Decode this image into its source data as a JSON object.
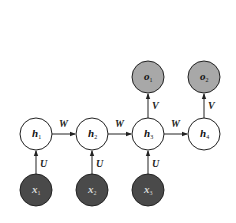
{
  "diagram": {
    "colors": {
      "hidden_fill": "#ffffff",
      "output_fill": "#a8a8a8",
      "input_fill": "#4a4a4a",
      "stroke": "#222222",
      "input_text": "#d8d8d8"
    },
    "hidden_nodes": [
      {
        "id": "h1",
        "base": "h",
        "sub": "1",
        "x": 36,
        "y": 134
      },
      {
        "id": "h2",
        "base": "h",
        "sub": "2",
        "x": 92,
        "y": 134
      },
      {
        "id": "h3",
        "base": "h",
        "sub": "3",
        "x": 148,
        "y": 134
      },
      {
        "id": "h4",
        "base": "h",
        "sub": "4",
        "x": 204,
        "y": 134
      }
    ],
    "output_nodes": [
      {
        "id": "o1",
        "base": "o",
        "sub": "1",
        "x": 148,
        "y": 77
      },
      {
        "id": "o2",
        "base": "o",
        "sub": "2",
        "x": 204,
        "y": 77
      }
    ],
    "input_nodes": [
      {
        "id": "x1",
        "base": "x",
        "sub": "1",
        "x": 36,
        "y": 190
      },
      {
        "id": "x2",
        "base": "x",
        "sub": "2",
        "x": 92,
        "y": 190
      },
      {
        "id": "x3",
        "base": "x",
        "sub": "3",
        "x": 148,
        "y": 190
      }
    ],
    "edges": [
      {
        "from": "x1",
        "to": "h1",
        "label": "U"
      },
      {
        "from": "x2",
        "to": "h2",
        "label": "U"
      },
      {
        "from": "x3",
        "to": "h3",
        "label": "U"
      },
      {
        "from": "h1",
        "to": "h2",
        "label": "W"
      },
      {
        "from": "h2",
        "to": "h3",
        "label": "W"
      },
      {
        "from": "h3",
        "to": "h4",
        "label": "W"
      },
      {
        "from": "h3",
        "to": "o1",
        "label": "V"
      },
      {
        "from": "h4",
        "to": "o2",
        "label": "V"
      }
    ]
  }
}
